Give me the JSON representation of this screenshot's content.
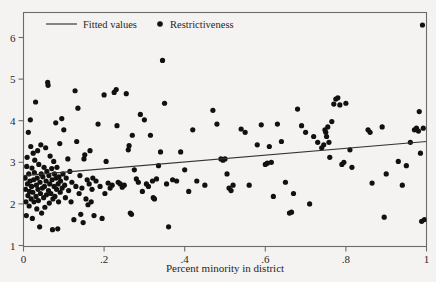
{
  "chart_data": {
    "type": "scatter",
    "title": "",
    "xlabel": "Percent minority in district",
    "ylabel": "",
    "xlim": [
      0,
      1
    ],
    "ylim": [
      1,
      6.5
    ],
    "grid": false,
    "xticks": [
      "0",
      ".2",
      ".4",
      ".6",
      ".8",
      "1"
    ],
    "xtick_values": [
      0,
      0.2,
      0.4,
      0.6,
      0.8,
      1
    ],
    "yticks": [
      "1",
      "2",
      "3",
      "4",
      "5",
      "6"
    ],
    "ytick_values": [
      1,
      2,
      3,
      4,
      5,
      6
    ],
    "legend_position": "top-left-inside",
    "series": [
      {
        "name": "Fitted values",
        "type": "line",
        "marker": "line",
        "endpoints": [
          [
            0,
            2.68
          ],
          [
            1,
            3.5
          ]
        ],
        "slope": 0.82,
        "intercept": 2.68
      },
      {
        "name": "Restrictiveness",
        "type": "scatter",
        "marker": "filled-circle",
        "points": [
          [
            0.004,
            2.62
          ],
          [
            0.005,
            2.35
          ],
          [
            0.006,
            2.05
          ],
          [
            0.007,
            1.72
          ],
          [
            0.008,
            2.9
          ],
          [
            0.009,
            3.12
          ],
          [
            0.01,
            2.48
          ],
          [
            0.011,
            2.2
          ],
          [
            0.012,
            3.72
          ],
          [
            0.013,
            2.72
          ],
          [
            0.014,
            1.95
          ],
          [
            0.015,
            2.3
          ],
          [
            0.016,
            2.55
          ],
          [
            0.017,
            4.02
          ],
          [
            0.018,
            3.38
          ],
          [
            0.019,
            2.12
          ],
          [
            0.02,
            2.42
          ],
          [
            0.021,
            2.86
          ],
          [
            0.022,
            1.65
          ],
          [
            0.023,
            2.28
          ],
          [
            0.024,
            3.22
          ],
          [
            0.025,
            2.58
          ],
          [
            0.026,
            2.05
          ],
          [
            0.027,
            2.75
          ],
          [
            0.028,
            3.05
          ],
          [
            0.03,
            4.45
          ],
          [
            0.031,
            2.18
          ],
          [
            0.032,
            2.45
          ],
          [
            0.033,
            1.88
          ],
          [
            0.034,
            2.62
          ],
          [
            0.035,
            3.28
          ],
          [
            0.036,
            2.35
          ],
          [
            0.037,
            2.08
          ],
          [
            0.038,
            2.95
          ],
          [
            0.04,
            1.45
          ],
          [
            0.041,
            2.52
          ],
          [
            0.042,
            2.25
          ],
          [
            0.043,
            3.42
          ],
          [
            0.044,
            2.72
          ],
          [
            0.045,
            1.78
          ],
          [
            0.047,
            2.38
          ],
          [
            0.048,
            2.65
          ],
          [
            0.05,
            2.15
          ],
          [
            0.051,
            2.88
          ],
          [
            0.052,
            2.42
          ],
          [
            0.053,
            1.92
          ],
          [
            0.055,
            3.35
          ],
          [
            0.056,
            2.55
          ],
          [
            0.057,
            2.22
          ],
          [
            0.058,
            2.78
          ],
          [
            0.06,
            4.92
          ],
          [
            0.061,
            4.85
          ],
          [
            0.062,
            2.32
          ],
          [
            0.063,
            2.68
          ],
          [
            0.064,
            2.02
          ],
          [
            0.065,
            2.48
          ],
          [
            0.066,
            3.15
          ],
          [
            0.068,
            2.25
          ],
          [
            0.07,
            2.85
          ],
          [
            0.071,
            2.58
          ],
          [
            0.072,
            1.38
          ],
          [
            0.073,
            2.12
          ],
          [
            0.075,
            3.02
          ],
          [
            0.076,
            2.42
          ],
          [
            0.077,
            2.72
          ],
          [
            0.078,
            2.18
          ],
          [
            0.08,
            3.95
          ],
          [
            0.081,
            2.62
          ],
          [
            0.082,
            2.35
          ],
          [
            0.083,
            2.88
          ],
          [
            0.085,
            1.4
          ],
          [
            0.086,
            2.48
          ],
          [
            0.087,
            2.05
          ],
          [
            0.088,
            2.65
          ],
          [
            0.09,
            3.45
          ],
          [
            0.091,
            2.28
          ],
          [
            0.092,
            2.55
          ],
          [
            0.095,
            4.05
          ],
          [
            0.096,
            2.38
          ],
          [
            0.098,
            2.72
          ],
          [
            0.1,
            3.78
          ],
          [
            0.102,
            2.45
          ],
          [
            0.104,
            2.15
          ],
          [
            0.106,
            2.62
          ],
          [
            0.11,
            3.08
          ],
          [
            0.112,
            2.32
          ],
          [
            0.115,
            2.78
          ],
          [
            0.118,
            2.05
          ],
          [
            0.12,
            2.52
          ],
          [
            0.125,
            1.62
          ],
          [
            0.128,
            4.72
          ],
          [
            0.13,
            2.42
          ],
          [
            0.132,
            3.5
          ],
          [
            0.135,
            4.3
          ],
          [
            0.138,
            2.25
          ],
          [
            0.14,
            2.68
          ],
          [
            0.142,
            1.75
          ],
          [
            0.145,
            2.38
          ],
          [
            0.148,
            1.55
          ],
          [
            0.15,
            3.08
          ],
          [
            0.152,
            3.18
          ],
          [
            0.155,
            2.12
          ],
          [
            0.158,
            2.58
          ],
          [
            0.16,
            1.98
          ],
          [
            0.163,
            2.48
          ],
          [
            0.165,
            3.28
          ],
          [
            0.168,
            2.05
          ],
          [
            0.17,
            2.35
          ],
          [
            0.172,
            2.62
          ],
          [
            0.175,
            1.72
          ],
          [
            0.18,
            2.55
          ],
          [
            0.185,
            3.92
          ],
          [
            0.19,
            2.42
          ],
          [
            0.195,
            1.65
          ],
          [
            0.2,
            4.62
          ],
          [
            0.202,
            2.25
          ],
          [
            0.205,
            3.02
          ],
          [
            0.21,
            2.5
          ],
          [
            0.215,
            2.38
          ],
          [
            0.22,
            2.45
          ],
          [
            0.225,
            4.68
          ],
          [
            0.23,
            4.75
          ],
          [
            0.232,
            3.88
          ],
          [
            0.235,
            2.52
          ],
          [
            0.24,
            2.48
          ],
          [
            0.245,
            2.4
          ],
          [
            0.25,
            2.45
          ],
          [
            0.255,
            4.65
          ],
          [
            0.26,
            3.3
          ],
          [
            0.262,
            3.4
          ],
          [
            0.265,
            1.78
          ],
          [
            0.268,
            1.75
          ],
          [
            0.27,
            3.65
          ],
          [
            0.275,
            2.82
          ],
          [
            0.28,
            2.6
          ],
          [
            0.285,
            2.52
          ],
          [
            0.29,
            4.15
          ],
          [
            0.295,
            2.3
          ],
          [
            0.3,
            4.02
          ],
          [
            0.305,
            2.48
          ],
          [
            0.31,
            2.42
          ],
          [
            0.315,
            3.65
          ],
          [
            0.32,
            2.55
          ],
          [
            0.322,
            2.15
          ],
          [
            0.325,
            2.12
          ],
          [
            0.33,
            2.6
          ],
          [
            0.335,
            2.92
          ],
          [
            0.34,
            3.25
          ],
          [
            0.345,
            5.45
          ],
          [
            0.35,
            4.42
          ],
          [
            0.355,
            2.48
          ],
          [
            0.36,
            1.45
          ],
          [
            0.37,
            2.58
          ],
          [
            0.38,
            2.55
          ],
          [
            0.39,
            3.25
          ],
          [
            0.4,
            2.82
          ],
          [
            0.41,
            2.3
          ],
          [
            0.42,
            3.78
          ],
          [
            0.43,
            2.55
          ],
          [
            0.45,
            2.45
          ],
          [
            0.47,
            4.25
          ],
          [
            0.48,
            3.92
          ],
          [
            0.49,
            3.08
          ],
          [
            0.495,
            3.05
          ],
          [
            0.5,
            3.08
          ],
          [
            0.505,
            2.72
          ],
          [
            0.51,
            2.38
          ],
          [
            0.515,
            2.32
          ],
          [
            0.52,
            2.45
          ],
          [
            0.54,
            3.8
          ],
          [
            0.55,
            3.72
          ],
          [
            0.56,
            2.45
          ],
          [
            0.58,
            3.42
          ],
          [
            0.59,
            3.9
          ],
          [
            0.6,
            2.95
          ],
          [
            0.605,
            2.98
          ],
          [
            0.61,
            3.38
          ],
          [
            0.615,
            3.0
          ],
          [
            0.62,
            2.18
          ],
          [
            0.63,
            3.92
          ],
          [
            0.64,
            3.5
          ],
          [
            0.65,
            2.52
          ],
          [
            0.66,
            1.78
          ],
          [
            0.665,
            1.8
          ],
          [
            0.67,
            2.25
          ],
          [
            0.68,
            4.28
          ],
          [
            0.69,
            3.88
          ],
          [
            0.7,
            3.72
          ],
          [
            0.71,
            2.0
          ],
          [
            0.72,
            3.62
          ],
          [
            0.73,
            3.48
          ],
          [
            0.74,
            3.35
          ],
          [
            0.745,
            3.42
          ],
          [
            0.748,
            3.78
          ],
          [
            0.75,
            3.72
          ],
          [
            0.752,
            3.62
          ],
          [
            0.755,
            3.85
          ],
          [
            0.758,
            3.48
          ],
          [
            0.76,
            3.12
          ],
          [
            0.765,
            3.98
          ],
          [
            0.77,
            4.4
          ],
          [
            0.775,
            4.52
          ],
          [
            0.78,
            4.55
          ],
          [
            0.785,
            4.38
          ],
          [
            0.79,
            2.95
          ],
          [
            0.795,
            3.0
          ],
          [
            0.8,
            4.42
          ],
          [
            0.81,
            3.3
          ],
          [
            0.815,
            2.88
          ],
          [
            0.855,
            3.78
          ],
          [
            0.86,
            3.72
          ],
          [
            0.865,
            2.5
          ],
          [
            0.89,
            3.85
          ],
          [
            0.895,
            1.68
          ],
          [
            0.9,
            2.72
          ],
          [
            0.93,
            3.02
          ],
          [
            0.94,
            2.45
          ],
          [
            0.95,
            2.92
          ],
          [
            0.96,
            3.48
          ],
          [
            0.97,
            3.78
          ],
          [
            0.975,
            3.82
          ],
          [
            0.98,
            3.75
          ],
          [
            0.982,
            4.22
          ],
          [
            0.985,
            3.22
          ],
          [
            0.988,
            1.58
          ],
          [
            0.99,
            6.3
          ],
          [
            0.992,
            3.82
          ],
          [
            0.995,
            1.62
          ]
        ]
      }
    ]
  },
  "legend": {
    "items": [
      {
        "label": "Fitted values",
        "marker": "line"
      },
      {
        "label": "Restrictiveness",
        "marker": "dot"
      }
    ]
  },
  "colors": {
    "point": "#121110",
    "line": "#35322f",
    "axis": "#6d6b68",
    "background": "#f4f3f1",
    "text": "#272625"
  }
}
